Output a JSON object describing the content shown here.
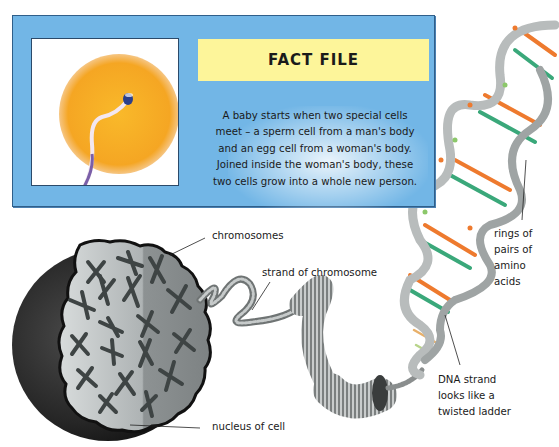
{
  "fact_file": {
    "title": "FACT FILE",
    "lines": [
      "A baby starts when two special cells",
      "meet – a sperm cell from a man's body",
      "and an egg cell from a woman's body.",
      "Joined inside the woman's body, these",
      "two cells grow into a whole new person."
    ],
    "image": "egg-and-sperm-illustration"
  },
  "labels": {
    "chromosomes": "chromosomes",
    "strand": "strand of chromosome",
    "nucleus": "nucleus of cell",
    "rings": [
      "rings of",
      "pairs of",
      "amino",
      "acids"
    ],
    "dna": [
      "DNA strand",
      "looks like a",
      "twisted ladder"
    ]
  },
  "colors": {
    "box_blue": "#72b6e6",
    "banner_yellow": "#fdf59a",
    "egg_orange": "#f5a623",
    "dna_orange": "#ee7a2e",
    "dna_green": "#3aa87a",
    "dna_ribbon": "#b8bcbc",
    "nucleus_dark": "#2a2a2a"
  }
}
